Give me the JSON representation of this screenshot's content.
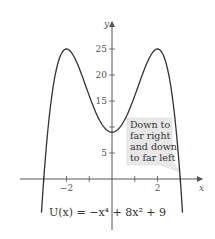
{
  "chart_data": {
    "type": "line",
    "title": "",
    "caption": "U(x) = −x⁴ + 8x² + 9",
    "xlabel": "x",
    "ylabel": "y",
    "xlim": [
      -3.3,
      3.3
    ],
    "ylim": [
      -4,
      28
    ],
    "x_ticks": [
      -3,
      -2,
      -1,
      1,
      2,
      3
    ],
    "x_tick_labels": [
      {
        "value": -2,
        "label": "−2"
      },
      {
        "value": 2,
        "label": "2"
      }
    ],
    "y_ticks": [
      5,
      10,
      15,
      20,
      25
    ],
    "y_tick_labels": [
      {
        "value": 5,
        "label": "5"
      },
      {
        "value": 15,
        "label": "15"
      },
      {
        "value": 20,
        "label": "20"
      },
      {
        "value": 25,
        "label": "25"
      }
    ],
    "grid": false,
    "series": [
      {
        "name": "U(x)",
        "expression": "-x^4 + 8x^2 + 9",
        "x": [
          -3.1,
          -3,
          -2.5,
          -2,
          -1.5,
          -1,
          -0.5,
          0,
          0.5,
          1,
          1.5,
          2,
          2.5,
          3,
          3.1
        ],
        "y": [
          -6.5,
          0,
          20.94,
          25,
          21.94,
          16,
          10.94,
          9,
          10.94,
          16,
          21.94,
          25,
          20.94,
          0,
          -6.5
        ]
      }
    ],
    "annotations": [
      {
        "text_lines": [
          "Down to",
          "far right",
          "and down",
          "to far left"
        ],
        "points_to": [
          3,
          0
        ]
      }
    ]
  },
  "caption": {
    "text": "U(x) = −x⁴ + 8x² + 9"
  }
}
